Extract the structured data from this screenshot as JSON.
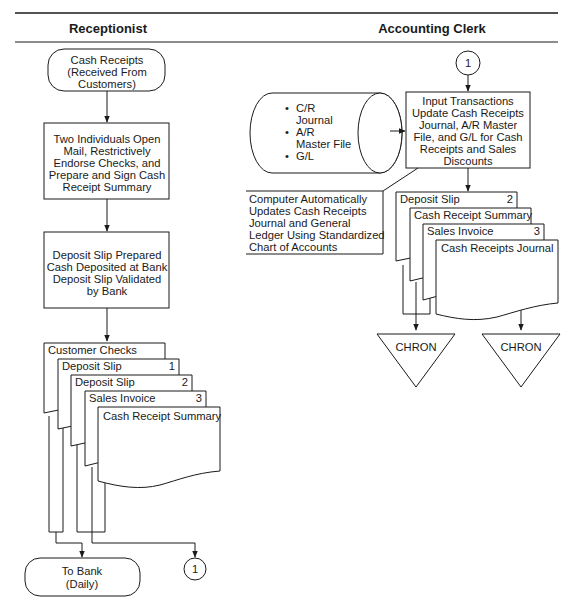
{
  "lanes": {
    "left": {
      "title": "Receptionist"
    },
    "right": {
      "title": "Accounting Clerk"
    }
  },
  "receptionist": {
    "start": {
      "lines": [
        "Cash Receipts",
        "(Received From",
        "Customers)"
      ]
    },
    "process1": {
      "lines": [
        "Two Individuals Open",
        "Mail, Restrictively",
        "Endorse Checks, and",
        "Prepare and Sign Cash",
        "Receipt Summary"
      ]
    },
    "process2": {
      "lines": [
        "Deposit Slip Prepared",
        "Cash Deposited at Bank",
        "Deposit Slip Validated",
        "by Bank"
      ]
    },
    "documents": [
      {
        "label": "Customer Checks",
        "number": ""
      },
      {
        "label": "Deposit Slip",
        "number": "1"
      },
      {
        "label": "Deposit Slip",
        "number": "2"
      },
      {
        "label": "Sales Invoice",
        "number": "3"
      },
      {
        "label": "Cash Receipt Summary",
        "number": ""
      }
    ],
    "end": {
      "lines": [
        "To Bank",
        "(Daily)"
      ]
    },
    "connector": {
      "label": "1"
    }
  },
  "accounting_clerk": {
    "connector": {
      "label": "1"
    },
    "disk": {
      "items": [
        "C/R",
        "Journal",
        "A/R",
        "Master File",
        "G/L"
      ],
      "bullets": [
        0,
        2,
        4
      ]
    },
    "process": {
      "lines": [
        "Input Transactions",
        "Update Cash Receipts",
        "Journal, A/R Master",
        "File, and G/L for Cash",
        "Receipts and Sales",
        "Discounts"
      ]
    },
    "annotation": {
      "lines": [
        "Computer Automatically",
        "Updates Cash Receipts",
        "Journal and General",
        "Ledger Using Standardized",
        "Chart of Accounts"
      ]
    },
    "documents": [
      {
        "label": "Deposit Slip",
        "number": "2"
      },
      {
        "label": "Cash Receipt Summary",
        "number": ""
      },
      {
        "label": "Sales Invoice",
        "number": "3"
      },
      {
        "label": "Cash Receipts Journal",
        "number": ""
      }
    ],
    "files": [
      {
        "label": "CHRON"
      },
      {
        "label": "CHRON"
      }
    ]
  }
}
